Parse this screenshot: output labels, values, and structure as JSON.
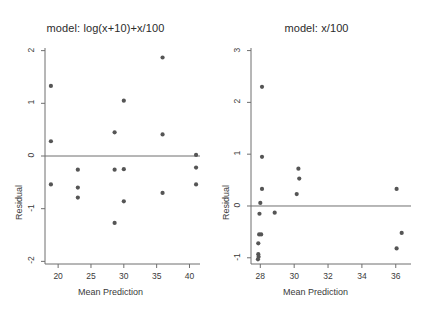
{
  "figure": {
    "background": "#ffffff",
    "point_color": "#555555",
    "axis_color": "#6f6f6f",
    "refline_color": "#6f6f6f",
    "text_color": "#3a3a3a"
  },
  "chart_data": [
    {
      "type": "scatter",
      "panel": "left",
      "title": "model: log(x+10)+x/100",
      "xlabel": "Mean Prediction",
      "ylabel": "Residual",
      "xlim": [
        18.0,
        41.6
      ],
      "ylim": [
        -2.05,
        2.05
      ],
      "xticks": [
        20,
        25,
        30,
        35,
        40
      ],
      "yticks": [
        -2,
        -1,
        0,
        1,
        2
      ],
      "xticklabels": [
        "20",
        "25",
        "30",
        "35",
        "40"
      ],
      "yticklabels": [
        "-2",
        "-1",
        "0",
        "1",
        "2"
      ],
      "grid": false,
      "legend": "none",
      "reference_line": {
        "orientation": "horizontal",
        "y": 0
      },
      "points": [
        {
          "x": 18.9,
          "y": 1.33
        },
        {
          "x": 18.9,
          "y": 0.28
        },
        {
          "x": 18.9,
          "y": -0.54
        },
        {
          "x": 23.0,
          "y": -0.26
        },
        {
          "x": 23.0,
          "y": -0.6
        },
        {
          "x": 23.0,
          "y": -0.79
        },
        {
          "x": 28.6,
          "y": 0.45
        },
        {
          "x": 28.6,
          "y": -0.26
        },
        {
          "x": 28.6,
          "y": -1.27
        },
        {
          "x": 30.0,
          "y": 1.05
        },
        {
          "x": 30.0,
          "y": -0.25
        },
        {
          "x": 30.0,
          "y": -0.86
        },
        {
          "x": 35.9,
          "y": 1.87
        },
        {
          "x": 35.9,
          "y": 0.41
        },
        {
          "x": 35.9,
          "y": -0.7
        },
        {
          "x": 41.0,
          "y": 0.02
        },
        {
          "x": 41.0,
          "y": -0.22
        },
        {
          "x": 41.0,
          "y": -0.54
        }
      ]
    },
    {
      "type": "scatter",
      "panel": "right",
      "title": "model: x/100",
      "xlabel": "Mean Prediction",
      "ylabel": "Residual",
      "xlim": [
        27.45,
        36.9
      ],
      "ylim": [
        -1.12,
        3.05
      ],
      "xticks": [
        28,
        30,
        32,
        34,
        36
      ],
      "yticks": [
        -1,
        0,
        1,
        2,
        3
      ],
      "xticklabels": [
        "28",
        "30",
        "32",
        "34",
        "36"
      ],
      "yticklabels": [
        "-1",
        "0",
        "1",
        "2",
        "3"
      ],
      "grid": false,
      "legend": "none",
      "reference_line": {
        "orientation": "horizontal",
        "y": 0
      },
      "points": [
        {
          "x": 28.1,
          "y": 2.3
        },
        {
          "x": 28.1,
          "y": 0.95
        },
        {
          "x": 30.25,
          "y": 0.72
        },
        {
          "x": 30.3,
          "y": 0.53
        },
        {
          "x": 28.1,
          "y": 0.33
        },
        {
          "x": 36.05,
          "y": 0.33
        },
        {
          "x": 30.15,
          "y": 0.23
        },
        {
          "x": 28.0,
          "y": 0.06
        },
        {
          "x": 27.95,
          "y": -0.15
        },
        {
          "x": 28.85,
          "y": -0.13
        },
        {
          "x": 36.35,
          "y": -0.52
        },
        {
          "x": 27.93,
          "y": -0.55
        },
        {
          "x": 28.05,
          "y": -0.55
        },
        {
          "x": 27.88,
          "y": -0.72
        },
        {
          "x": 36.05,
          "y": -0.82
        },
        {
          "x": 27.88,
          "y": -0.93
        },
        {
          "x": 27.9,
          "y": -0.98
        },
        {
          "x": 27.86,
          "y": -1.03
        }
      ]
    }
  ]
}
